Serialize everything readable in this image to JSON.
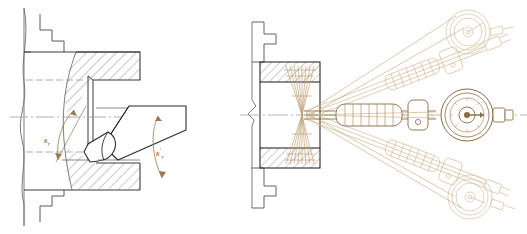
{
  "drawing": {
    "title": "Boring tool geometry and boring bar adjustment assembly",
    "sheet": {
      "width": 527,
      "height": 234,
      "background": "#ffffff"
    },
    "palette": {
      "outline": "#4a4a4a",
      "outline_dark": "#2b2b2b",
      "hatch": "#8a8a8a",
      "centerline": "#9a9a9a",
      "hidden": "#9a9a9a",
      "tool_brown": "#8a6a42",
      "ghost_tan": "#c9ae8a",
      "ghost_light": "#ddc9ae",
      "label_color": "#7a5c3a"
    }
  },
  "left_view": {
    "name": "Boring tool in bore - enlarged detail",
    "labels": {
      "major_angle": {
        "symbol": "κ",
        "sub": "r",
        "prime": "",
        "text": "κr"
      },
      "minor_angle": {
        "symbol": "κ",
        "sub": "r",
        "prime": "′",
        "text": "κ′r"
      }
    },
    "features": [
      "workpiece-section-hatched",
      "bore-wall-upper",
      "bore-wall-lower",
      "stepped-flange-top",
      "stepped-flange-bottom",
      "break-line-left",
      "boring-bar-shank",
      "cutting-insert",
      "angle-arc-major",
      "angle-arc-minor",
      "centerline-axis",
      "hidden-line-upper",
      "hidden-line-lower"
    ]
  },
  "right_view": {
    "name": "Boring bar with dial indicator - three angular positions",
    "features": [
      "workpiece-section-hatched",
      "bore-cavity",
      "stepped-flange-top",
      "stepped-flange-bottom",
      "break-symbol-left",
      "centerline-axis",
      "boring-bar-center",
      "knurled-grip-center",
      "bracket-clamp-center",
      "dial-indicator-center",
      "boring-bar-upper-ghost",
      "dial-indicator-upper-ghost",
      "boring-bar-lower-ghost",
      "dial-indicator-lower-ghost",
      "ray-fan-hourglass"
    ],
    "positions": [
      {
        "id": "upper",
        "style": "phantom",
        "angle_deg": -22
      },
      {
        "id": "center",
        "style": "solid",
        "angle_deg": 0
      },
      {
        "id": "lower",
        "style": "phantom",
        "angle_deg": 22
      }
    ]
  }
}
